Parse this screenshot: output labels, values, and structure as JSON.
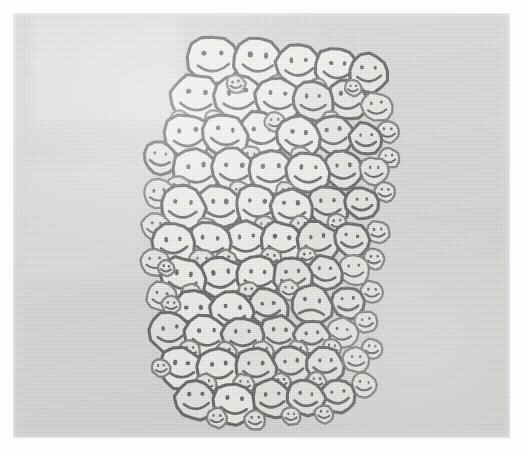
{
  "image": {
    "title": "Crowd of hand-drawn smiley faces",
    "description": "A dense hand-drawn cluster of round smiley faces packed together on a gray photocopied page, with a single frowning sad face hidden among them.",
    "medium": "pen drawing, photocopy / scan",
    "canvas": {
      "width": 528,
      "height": 456,
      "outer_background_color": "#fdfdfd",
      "paper_color": "#d6d6d4",
      "paper_left": 13,
      "paper_top": 13,
      "paper_width": 497,
      "paper_height": 425
    },
    "style": {
      "outline_color": "#4a4a48",
      "outline_color_light": "#6a6a66",
      "face_fill_color": "#e9e9e6",
      "face_fill_highlight": "#f3f3f0",
      "stroke_width_large": 3.1,
      "stroke_width_small": 2.3
    },
    "cluster": {
      "label": "smiley-face-crowd",
      "bounds": {
        "left": 145,
        "top": 28,
        "right": 378,
        "bottom": 428
      },
      "total_faces": 118,
      "happy_faces": 117,
      "sad_faces": 1
    },
    "annotations": [
      {
        "name": "odd-one-out",
        "label": "sad face",
        "x": 312,
        "y": 305
      }
    ]
  },
  "faces": [
    {
      "x": 213,
      "y": 60,
      "r": 25,
      "m": "smile",
      "t": -4
    },
    {
      "x": 258,
      "y": 61,
      "r": 24,
      "m": "smile",
      "t": 3
    },
    {
      "x": 299,
      "y": 66,
      "r": 22,
      "m": "smile",
      "t": -2
    },
    {
      "x": 337,
      "y": 69,
      "r": 21,
      "m": "smile",
      "t": 5
    },
    {
      "x": 369,
      "y": 73,
      "r": 19,
      "m": "smile",
      "t": -3
    },
    {
      "x": 196,
      "y": 99,
      "r": 25,
      "m": "smile",
      "t": 2
    },
    {
      "x": 238,
      "y": 98,
      "r": 24,
      "m": "smile",
      "t": -5
    },
    {
      "x": 278,
      "y": 99,
      "r": 22,
      "m": "smile",
      "t": 4
    },
    {
      "x": 313,
      "y": 101,
      "r": 20,
      "m": "smile",
      "t": -2
    },
    {
      "x": 347,
      "y": 100,
      "r": 20,
      "m": "smile",
      "t": 3
    },
    {
      "x": 377,
      "y": 107,
      "r": 15,
      "m": "smile",
      "t": -4
    },
    {
      "x": 188,
      "y": 136,
      "r": 23,
      "m": "smile",
      "t": -3
    },
    {
      "x": 225,
      "y": 135,
      "r": 22,
      "m": "smile",
      "t": 4
    },
    {
      "x": 262,
      "y": 134,
      "r": 22,
      "m": "smile",
      "t": -2
    },
    {
      "x": 299,
      "y": 137,
      "r": 21,
      "m": "smile",
      "t": 3
    },
    {
      "x": 334,
      "y": 135,
      "r": 20,
      "m": "smile",
      "t": -4
    },
    {
      "x": 366,
      "y": 139,
      "r": 16,
      "m": "smile",
      "t": 2
    },
    {
      "x": 388,
      "y": 132,
      "r": 11,
      "m": "smile",
      "t": -3
    },
    {
      "x": 160,
      "y": 158,
      "r": 16,
      "m": "smile",
      "t": 5
    },
    {
      "x": 196,
      "y": 172,
      "r": 23,
      "m": "smile",
      "t": -3
    },
    {
      "x": 234,
      "y": 171,
      "r": 22,
      "m": "smile",
      "t": 3
    },
    {
      "x": 271,
      "y": 172,
      "r": 22,
      "m": "smile",
      "t": -4
    },
    {
      "x": 308,
      "y": 173,
      "r": 21,
      "m": "smile",
      "t": 2
    },
    {
      "x": 343,
      "y": 170,
      "r": 19,
      "m": "smile",
      "t": -2
    },
    {
      "x": 374,
      "y": 171,
      "r": 14,
      "m": "smile",
      "t": 4
    },
    {
      "x": 389,
      "y": 158,
      "r": 10,
      "m": "smile",
      "t": -2
    },
    {
      "x": 159,
      "y": 194,
      "r": 15,
      "m": "smile",
      "t": -4
    },
    {
      "x": 183,
      "y": 208,
      "r": 22,
      "m": "smile",
      "t": 3
    },
    {
      "x": 220,
      "y": 207,
      "r": 22,
      "m": "smile",
      "t": -3
    },
    {
      "x": 257,
      "y": 207,
      "r": 21,
      "m": "smile",
      "t": 4
    },
    {
      "x": 292,
      "y": 209,
      "r": 21,
      "m": "smile",
      "t": -2
    },
    {
      "x": 328,
      "y": 206,
      "r": 20,
      "m": "smile",
      "t": 3
    },
    {
      "x": 362,
      "y": 203,
      "r": 16,
      "m": "smile",
      "t": -4
    },
    {
      "x": 385,
      "y": 192,
      "r": 10,
      "m": "smile",
      "t": 2
    },
    {
      "x": 156,
      "y": 227,
      "r": 14,
      "m": "smile",
      "t": 4
    },
    {
      "x": 174,
      "y": 244,
      "r": 21,
      "m": "smile",
      "t": -3
    },
    {
      "x": 210,
      "y": 243,
      "r": 21,
      "m": "smile",
      "t": 2
    },
    {
      "x": 246,
      "y": 242,
      "r": 21,
      "m": "smile",
      "t": -4
    },
    {
      "x": 282,
      "y": 243,
      "r": 21,
      "m": "smile",
      "t": 3
    },
    {
      "x": 318,
      "y": 242,
      "r": 20,
      "m": "smile",
      "t": -2
    },
    {
      "x": 352,
      "y": 240,
      "r": 17,
      "m": "smile",
      "t": 4
    },
    {
      "x": 378,
      "y": 232,
      "r": 11,
      "m": "smile",
      "t": -3
    },
    {
      "x": 155,
      "y": 262,
      "r": 14,
      "m": "smile",
      "t": -2
    },
    {
      "x": 183,
      "y": 279,
      "r": 22,
      "m": "smile",
      "t": 3
    },
    {
      "x": 221,
      "y": 278,
      "r": 22,
      "m": "smile",
      "t": -4
    },
    {
      "x": 258,
      "y": 277,
      "r": 21,
      "m": "smile",
      "t": 2
    },
    {
      "x": 293,
      "y": 276,
      "r": 19,
      "m": "smile",
      "t": -3
    },
    {
      "x": 325,
      "y": 273,
      "r": 17,
      "m": "smile",
      "t": 4
    },
    {
      "x": 354,
      "y": 270,
      "r": 15,
      "m": "smile",
      "t": -2
    },
    {
      "x": 374,
      "y": 259,
      "r": 10,
      "m": "smile",
      "t": 3
    },
    {
      "x": 162,
      "y": 297,
      "r": 15,
      "m": "smile",
      "t": 3
    },
    {
      "x": 194,
      "y": 313,
      "r": 22,
      "m": "smile",
      "t": -3
    },
    {
      "x": 232,
      "y": 312,
      "r": 21,
      "m": "smile",
      "t": 4
    },
    {
      "x": 268,
      "y": 308,
      "r": 19,
      "m": "smile",
      "t": -2
    },
    {
      "x": 312,
      "y": 305,
      "r": 20,
      "m": "frown",
      "t": 3
    },
    {
      "x": 348,
      "y": 303,
      "r": 16,
      "m": "smile",
      "t": -4
    },
    {
      "x": 372,
      "y": 292,
      "r": 11,
      "m": "smile",
      "t": 2
    },
    {
      "x": 170,
      "y": 333,
      "r": 20,
      "m": "smile",
      "t": -3
    },
    {
      "x": 206,
      "y": 336,
      "r": 21,
      "m": "smile",
      "t": 3
    },
    {
      "x": 243,
      "y": 337,
      "r": 20,
      "m": "smile",
      "t": -2
    },
    {
      "x": 279,
      "y": 335,
      "r": 19,
      "m": "smile",
      "t": 4
    },
    {
      "x": 312,
      "y": 337,
      "r": 17,
      "m": "smile",
      "t": -3
    },
    {
      "x": 342,
      "y": 333,
      "r": 15,
      "m": "smile",
      "t": 2
    },
    {
      "x": 366,
      "y": 322,
      "r": 11,
      "m": "smile",
      "t": -4
    },
    {
      "x": 181,
      "y": 368,
      "r": 21,
      "m": "smile",
      "t": 3
    },
    {
      "x": 219,
      "y": 369,
      "r": 21,
      "m": "smile",
      "t": -4
    },
    {
      "x": 256,
      "y": 368,
      "r": 20,
      "m": "smile",
      "t": 2
    },
    {
      "x": 291,
      "y": 366,
      "r": 19,
      "m": "smile",
      "t": -3
    },
    {
      "x": 325,
      "y": 365,
      "r": 18,
      "m": "smile",
      "t": 4
    },
    {
      "x": 356,
      "y": 360,
      "r": 13,
      "m": "smile",
      "t": -2
    },
    {
      "x": 372,
      "y": 349,
      "r": 10,
      "m": "smile",
      "t": 3
    },
    {
      "x": 196,
      "y": 400,
      "r": 20,
      "m": "smile",
      "t": -3
    },
    {
      "x": 234,
      "y": 404,
      "r": 21,
      "m": "smile",
      "t": 3
    },
    {
      "x": 272,
      "y": 399,
      "r": 19,
      "m": "smile",
      "t": -2
    },
    {
      "x": 306,
      "y": 398,
      "r": 18,
      "m": "smile",
      "t": 4
    },
    {
      "x": 338,
      "y": 396,
      "r": 17,
      "m": "smile",
      "t": -3
    },
    {
      "x": 364,
      "y": 385,
      "r": 12,
      "m": "smile",
      "t": 2
    },
    {
      "x": 178,
      "y": 188,
      "r": 12,
      "m": "smile",
      "t": 4
    },
    {
      "x": 202,
      "y": 262,
      "r": 13,
      "m": "smile",
      "t": -3
    },
    {
      "x": 240,
      "y": 192,
      "r": 11,
      "m": "smile",
      "t": 2
    },
    {
      "x": 275,
      "y": 122,
      "r": 10,
      "m": "smile",
      "t": -4
    },
    {
      "x": 301,
      "y": 157,
      "r": 10,
      "m": "smile",
      "t": 3
    },
    {
      "x": 215,
      "y": 120,
      "r": 10,
      "m": "smile",
      "t": -2
    },
    {
      "x": 251,
      "y": 156,
      "r": 10,
      "m": "smile",
      "t": 4
    },
    {
      "x": 331,
      "y": 120,
      "r": 9,
      "m": "smile",
      "t": -3
    },
    {
      "x": 180,
      "y": 120,
      "r": 9,
      "m": "smile",
      "t": 2
    },
    {
      "x": 286,
      "y": 192,
      "r": 10,
      "m": "smile",
      "t": -4
    },
    {
      "x": 207,
      "y": 228,
      "r": 10,
      "m": "smile",
      "t": 3
    },
    {
      "x": 265,
      "y": 226,
      "r": 10,
      "m": "smile",
      "t": -2
    },
    {
      "x": 301,
      "y": 226,
      "r": 10,
      "m": "smile",
      "t": 4
    },
    {
      "x": 337,
      "y": 223,
      "r": 9,
      "m": "smile",
      "t": -3
    },
    {
      "x": 192,
      "y": 294,
      "r": 10,
      "m": "smile",
      "t": 2
    },
    {
      "x": 249,
      "y": 292,
      "r": 10,
      "m": "smile",
      "t": -4
    },
    {
      "x": 289,
      "y": 290,
      "r": 10,
      "m": "smile",
      "t": 3
    },
    {
      "x": 226,
      "y": 260,
      "r": 10,
      "m": "smile",
      "t": -2
    },
    {
      "x": 271,
      "y": 258,
      "r": 10,
      "m": "smile",
      "t": 4
    },
    {
      "x": 307,
      "y": 256,
      "r": 9,
      "m": "smile",
      "t": -3
    },
    {
      "x": 190,
      "y": 350,
      "r": 10,
      "m": "smile",
      "t": 2
    },
    {
      "x": 226,
      "y": 352,
      "r": 10,
      "m": "smile",
      "t": -4
    },
    {
      "x": 263,
      "y": 351,
      "r": 10,
      "m": "smile",
      "t": 3
    },
    {
      "x": 298,
      "y": 350,
      "r": 9,
      "m": "smile",
      "t": -2
    },
    {
      "x": 332,
      "y": 348,
      "r": 9,
      "m": "smile",
      "t": 4
    },
    {
      "x": 206,
      "y": 384,
      "r": 10,
      "m": "smile",
      "t": -3
    },
    {
      "x": 244,
      "y": 384,
      "r": 10,
      "m": "smile",
      "t": 2
    },
    {
      "x": 281,
      "y": 382,
      "r": 9,
      "m": "smile",
      "t": -4
    },
    {
      "x": 317,
      "y": 381,
      "r": 9,
      "m": "smile",
      "t": 3
    },
    {
      "x": 171,
      "y": 305,
      "r": 9,
      "m": "smile",
      "t": -2
    },
    {
      "x": 166,
      "y": 268,
      "r": 8,
      "m": "smile",
      "t": 4
    },
    {
      "x": 236,
      "y": 84,
      "r": 9,
      "m": "smile",
      "t": -3
    },
    {
      "x": 278,
      "y": 84,
      "r": 9,
      "m": "smile",
      "t": 2
    },
    {
      "x": 318,
      "y": 86,
      "r": 8,
      "m": "smile",
      "t": -4
    },
    {
      "x": 353,
      "y": 88,
      "r": 8,
      "m": "smile",
      "t": 3
    },
    {
      "x": 217,
      "y": 418,
      "r": 10,
      "m": "smile",
      "t": -2
    },
    {
      "x": 255,
      "y": 420,
      "r": 10,
      "m": "smile",
      "t": 4
    },
    {
      "x": 291,
      "y": 416,
      "r": 9,
      "m": "smile",
      "t": -3
    },
    {
      "x": 324,
      "y": 414,
      "r": 9,
      "m": "smile",
      "t": 2
    },
    {
      "x": 161,
      "y": 368,
      "r": 9,
      "m": "smile",
      "t": -4
    }
  ]
}
